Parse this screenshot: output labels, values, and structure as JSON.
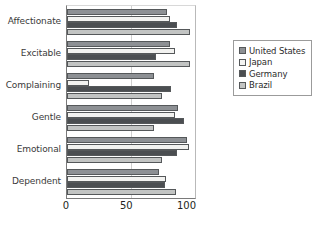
{
  "chart_data": {
    "type": "bar",
    "orientation": "horizontal",
    "title": "",
    "xlabel": "",
    "ylabel": "",
    "xlim": [
      0,
      107
    ],
    "xticks": [
      0,
      50,
      100
    ],
    "grid": "vertical-at-50",
    "legend_position": "right",
    "categories": [
      "Affectionate",
      "Excitable",
      "Complaining",
      "Gentle",
      "Emotional",
      "Dependent"
    ],
    "series": [
      {
        "name": "United States",
        "color": "#8d9094",
        "values": [
          84,
          86,
          73,
          93,
          100,
          77
        ]
      },
      {
        "name": "Japan",
        "color": "#f2f2f0",
        "values": [
          86,
          90,
          18,
          90,
          102,
          83
        ]
      },
      {
        "name": "Germany",
        "color": "#4b4e51",
        "values": [
          92,
          74,
          87,
          98,
          92,
          82
        ]
      },
      {
        "name": "Brazil",
        "color": "#c2c4c3",
        "values": [
          103,
          103,
          79,
          73,
          79,
          91
        ]
      }
    ]
  },
  "legend": {
    "items": [
      {
        "label": "United States"
      },
      {
        "label": "Japan"
      },
      {
        "label": "Germany"
      },
      {
        "label": "Brazil"
      }
    ]
  },
  "axis": {
    "ticks": [
      {
        "label": "0"
      },
      {
        "label": "50"
      },
      {
        "label": "100"
      }
    ]
  }
}
